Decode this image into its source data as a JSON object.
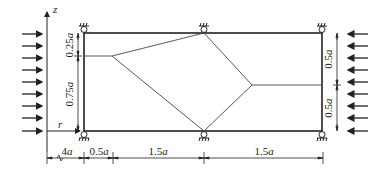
{
  "diagram": {
    "axes": {
      "z_label": "z",
      "r_label": "r"
    },
    "left_dims": [
      {
        "value": "0.25",
        "unit": "a"
      },
      {
        "value": "0.75",
        "unit": "a"
      }
    ],
    "right_dims": [
      {
        "value": "0.5",
        "unit": "a"
      },
      {
        "value": "0.5",
        "unit": "a"
      }
    ],
    "bottom_dims": [
      {
        "value": "4",
        "unit": "a"
      },
      {
        "value": "0.5",
        "unit": "a"
      },
      {
        "value": "1.5",
        "unit": "a"
      },
      {
        "value": "1.5",
        "unit": "a"
      }
    ],
    "colors": {
      "line": "#222222",
      "thin": "#444444"
    },
    "left_load_arrow_count": 9,
    "right_load_arrow_count": 9
  }
}
